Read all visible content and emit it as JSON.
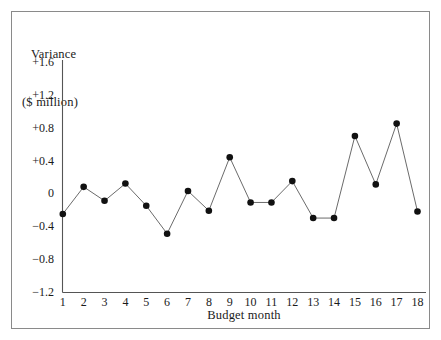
{
  "figure": {
    "frame_color": "#8a8a8a",
    "axis_color": "#555555",
    "line_color": "#6b6b6b",
    "marker_color": "#111111"
  },
  "chart_data": {
    "type": "line",
    "title": "",
    "ylabel_line1": "Variance",
    "ylabel_line2": "($ million)",
    "xlabel": "Budget month",
    "categories": [
      "1",
      "2",
      "3",
      "4",
      "5",
      "6",
      "7",
      "8",
      "9",
      "10",
      "11",
      "12",
      "13",
      "14",
      "15",
      "16",
      "17",
      "18"
    ],
    "x": [
      1,
      2,
      3,
      4,
      5,
      6,
      7,
      8,
      9,
      10,
      11,
      12,
      13,
      14,
      15,
      16,
      17,
      18
    ],
    "values": [
      -0.25,
      0.08,
      -0.09,
      0.12,
      -0.15,
      -0.49,
      0.03,
      -0.21,
      0.44,
      -0.11,
      -0.11,
      0.15,
      -0.3,
      -0.3,
      0.7,
      0.11,
      0.85,
      -0.22
    ],
    "ylim": [
      -1.2,
      1.6
    ],
    "yticks": [
      1.6,
      1.2,
      0.8,
      0.4,
      0,
      -0.4,
      -0.8,
      -1.2
    ],
    "ytick_labels": [
      "+1.6",
      "+1.2",
      "+0.8",
      "+0.4",
      "0",
      "−0.4",
      "−0.8",
      "−1.2"
    ],
    "xlim": [
      0.6,
      18.4
    ],
    "grid": false,
    "legend": "none",
    "markers": "filled-circle"
  }
}
